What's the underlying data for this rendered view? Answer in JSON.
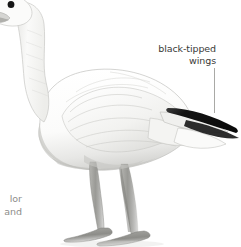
{
  "figure": {
    "background_color": "#ffffff",
    "annotations": {
      "wing_label_line1": "black-tipped",
      "wing_label_line2": "wings",
      "wing_label_color": "#3a3a38",
      "leader_line_color": "#a9a9a6"
    },
    "clipped_caption": {
      "line1": "lor",
      "line2": "and",
      "color": "#8d8d8a"
    },
    "parts": {
      "eye": "eye",
      "bill": "bill",
      "head": "head",
      "neck": "neck",
      "body": "body",
      "wing": "wing",
      "wingtip": "black-wingtip",
      "tail": "tail",
      "leg_front": "front-leg",
      "leg_back": "back-leg",
      "foot_front": "front-webbed-foot",
      "foot_back": "back-webbed-foot"
    },
    "colors": {
      "plumage_white": "#ffffff",
      "plumage_shadow": "#d8d8d6",
      "plumage_midtone": "#eeeeec",
      "outline": "#b6b6b3",
      "wingtip_black": "#121212",
      "leg_gray": "#9b9b97",
      "leg_shadow": "#6e6e6a",
      "eye_black": "#151515"
    }
  }
}
